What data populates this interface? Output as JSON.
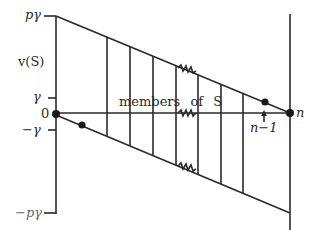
{
  "diagram": {
    "type": "set-function-bounds-diagram",
    "y_axis": {
      "label": "v(S)",
      "ticks": [
        {
          "label": "pγ",
          "value": "p*gamma"
        },
        {
          "label": "γ",
          "value": "gamma"
        },
        {
          "label": "0",
          "value": "0"
        },
        {
          "label": "−γ",
          "value": "-gamma"
        },
        {
          "label": "−pγ",
          "value": "-p*gamma"
        }
      ]
    },
    "x_axis": {
      "end_label": "n",
      "marker_label": "n−1"
    },
    "center_label": "members of S",
    "elements": {
      "upper_boundary": "line from (0, pγ) to (n, 0)",
      "lower_boundary": "line from (0, 0) to (n, −pγ)",
      "vertical_lines": 7,
      "break_marks": 3,
      "points": [
        "origin",
        "lower point near origin",
        "n−1 on upper boundary",
        "n"
      ]
    },
    "colors": {
      "ink": "#2a2a2a",
      "background": "#ffffff"
    }
  }
}
